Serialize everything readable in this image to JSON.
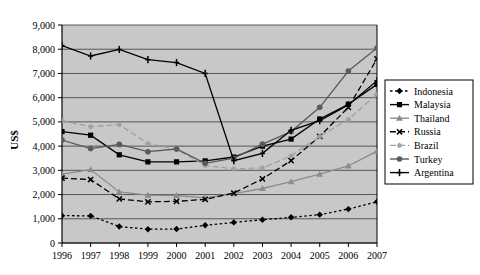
{
  "chart_data": {
    "type": "line",
    "title": "",
    "xlabel": "",
    "ylabel": "US$",
    "categories": [
      1996,
      1997,
      1998,
      1999,
      2000,
      2001,
      2002,
      2003,
      2004,
      2005,
      2006,
      2007
    ],
    "xtick_labels": [
      "1996",
      "1997",
      "1998",
      "1999",
      "2000",
      "2001",
      "2002",
      "2003",
      "2004",
      "2005",
      "2006",
      "2007"
    ],
    "ytick_labels": [
      "0",
      "1,000",
      "2,000",
      "3,000",
      "4,000",
      "5,000",
      "6,000",
      "7,000",
      "8,000",
      "9,000"
    ],
    "yticks": [
      0,
      1000,
      2000,
      3000,
      4000,
      5000,
      6000,
      7000,
      8000,
      9000
    ],
    "ylim": [
      0,
      9000
    ],
    "grid": true,
    "grid_axis": "y",
    "legend_position": "right",
    "plot_background": "#c8c8c8",
    "series": [
      {
        "name": "Indonesia",
        "color": "#000000",
        "dash": "dotted",
        "marker": "diamond",
        "values": [
          1130,
          1120,
          680,
          570,
          575,
          730,
          850,
          960,
          1060,
          1170,
          1400,
          1700
        ]
      },
      {
        "name": "Malaysia",
        "color": "#000000",
        "dash": "solid",
        "marker": "square",
        "values": [
          4600,
          4450,
          3640,
          3350,
          3350,
          3390,
          3550,
          4000,
          4290,
          5120,
          5730,
          6550
        ]
      },
      {
        "name": "Thailand",
        "color": "#8c8c8c",
        "dash": "solid",
        "marker": "triangle",
        "values": [
          2840,
          3030,
          2110,
          1980,
          1960,
          1860,
          2040,
          2250,
          2530,
          2840,
          3180,
          3790
        ]
      },
      {
        "name": "Russia",
        "color": "#000000",
        "dash": "dashed",
        "marker": "x",
        "values": [
          2680,
          2620,
          1820,
          1700,
          1720,
          1800,
          2060,
          2650,
          3400,
          4400,
          5600,
          7600
        ]
      },
      {
        "name": "Brazil",
        "color": "#a0a0a0",
        "dash": "dashed",
        "marker": "asterisk",
        "values": [
          5050,
          4800,
          4890,
          4110,
          3870,
          3200,
          3060,
          3100,
          3600,
          4400,
          5100,
          6150
        ]
      },
      {
        "name": "Turkey",
        "color": "#5a5a5a",
        "dash": "solid",
        "marker": "circle",
        "values": [
          4250,
          3900,
          4070,
          3770,
          3880,
          3290,
          3500,
          4080,
          4600,
          5600,
          7100,
          8050
        ]
      },
      {
        "name": "Argentina",
        "color": "#000000",
        "dash": "solid",
        "marker": "plus",
        "values": [
          8150,
          7720,
          7990,
          7570,
          7450,
          7000,
          3400,
          3700,
          4650,
          5050,
          5700,
          6700
        ]
      }
    ]
  },
  "legend": {
    "items": [
      {
        "label": "Indonesia"
      },
      {
        "label": "Malaysia"
      },
      {
        "label": "Thailand"
      },
      {
        "label": "Russia"
      },
      {
        "label": "Brazil"
      },
      {
        "label": "Turkey"
      },
      {
        "label": "Argentina"
      }
    ]
  }
}
